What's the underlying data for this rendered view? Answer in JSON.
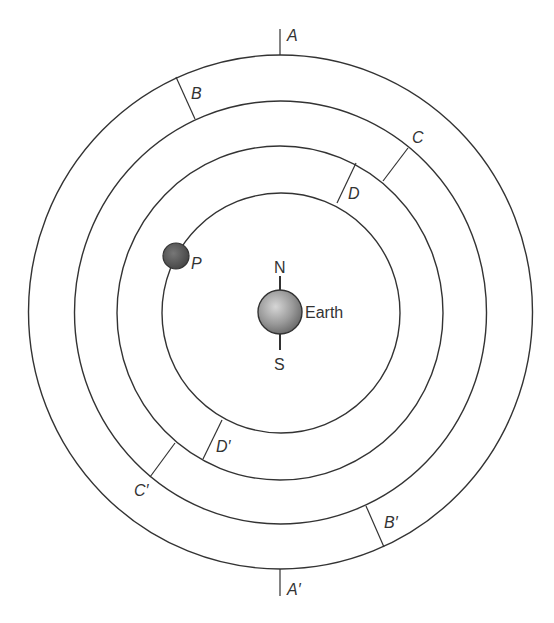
{
  "diagram": {
    "center_body": {
      "label": "Earth",
      "north": "N",
      "south": "S"
    },
    "moon": {
      "label": "P"
    },
    "orbit_markers": [
      {
        "label": "A"
      },
      {
        "label": "A′"
      },
      {
        "label": "B"
      },
      {
        "label": "B′"
      },
      {
        "label": "C"
      },
      {
        "label": "C′"
      },
      {
        "label": "D"
      },
      {
        "label": "D′"
      }
    ]
  }
}
